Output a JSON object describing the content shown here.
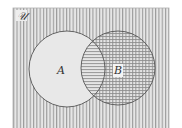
{
  "diagram": {
    "type": "venn",
    "universe_label": "𝒰",
    "sets": [
      {
        "label": "A",
        "cx": 67,
        "cy": 69,
        "r": 38
      },
      {
        "label": "B",
        "cx": 118,
        "cy": 68,
        "r": 37
      }
    ],
    "shading": {
      "outside": "vertical-lines",
      "A_only": "plain",
      "A_and_B": "horizontal-lines",
      "B_only": "grid"
    },
    "colors": {
      "background": "#e8e8e8",
      "hatch": "#8a8a8a",
      "outline": "#555555",
      "frame": "#9a9a9a"
    }
  }
}
